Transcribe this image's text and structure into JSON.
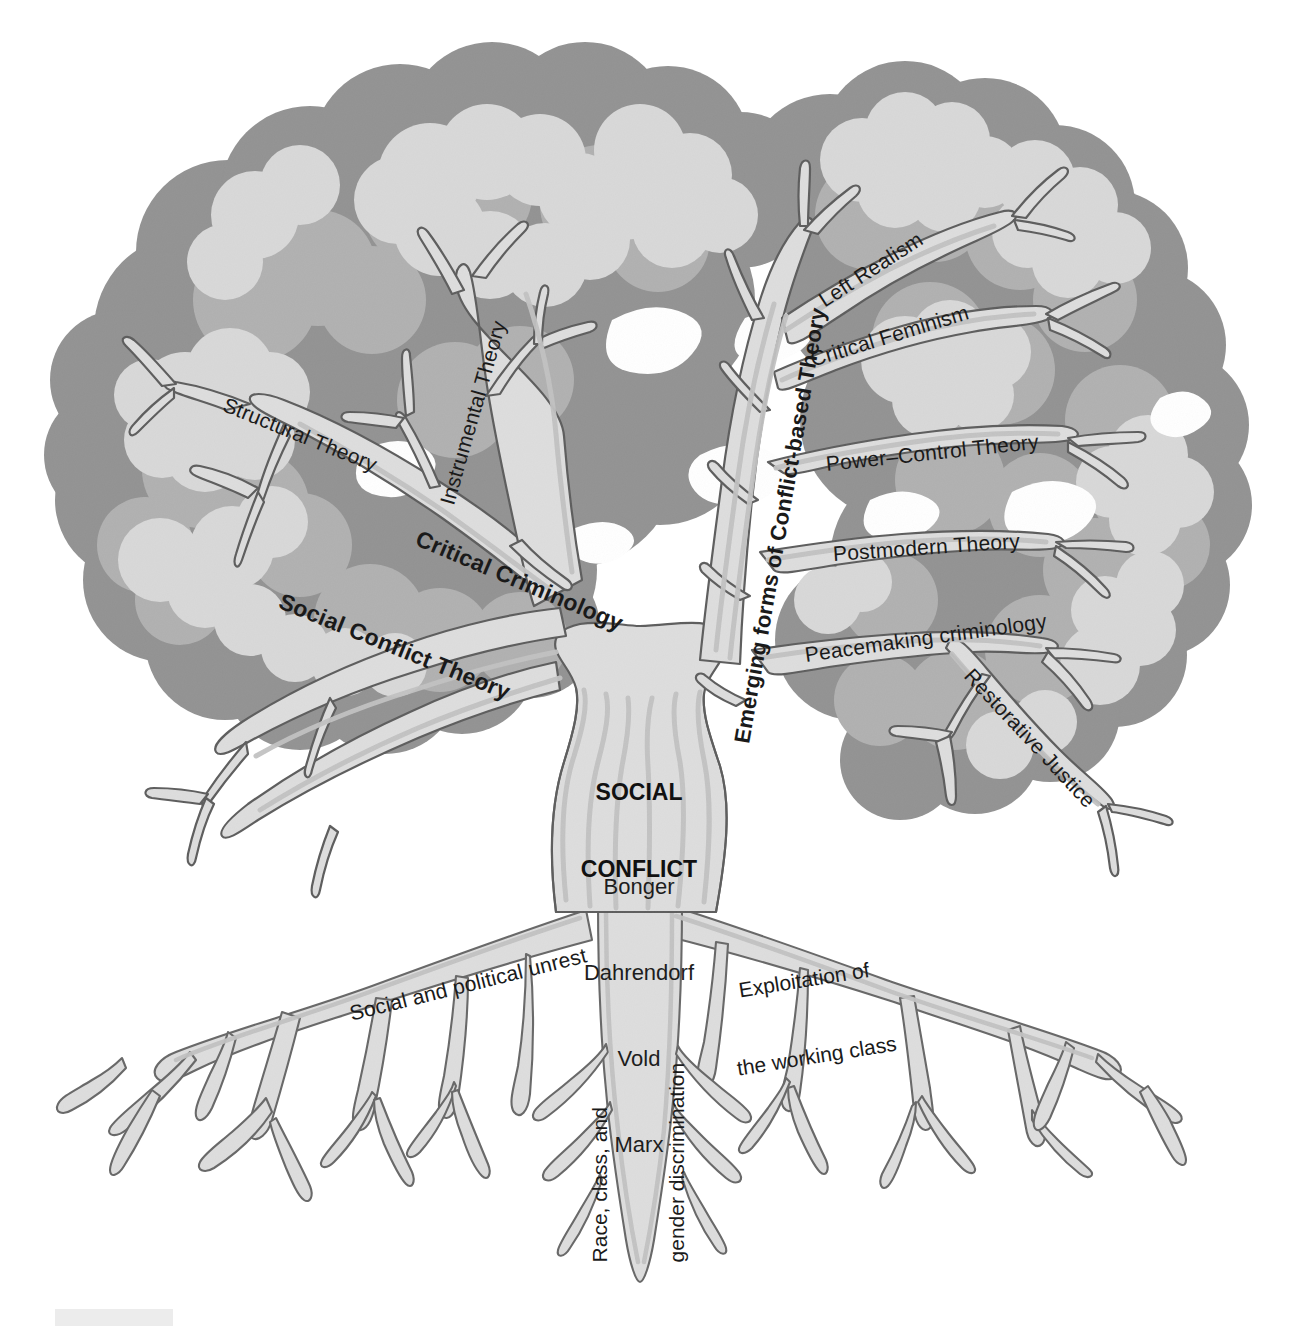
{
  "figure": {
    "kind": "concept-tree-diagram",
    "background_color": "#ffffff"
  },
  "palette": {
    "canopy_dark": "#949494",
    "canopy_mid": "#b2b2b2",
    "canopy_light": "#d9d9d9",
    "wood_fill": "#dedede",
    "wood_shadow": "#c3c3c3",
    "outline": "#5f5f5f",
    "text": "#1a1a1a",
    "footer_bar": "#ececec"
  },
  "trunk": {
    "core_label": "SOCIAL\nCONFLICT",
    "core_label_line1": "SOCIAL",
    "core_label_line2": "CONFLICT",
    "theorists_block": "Bonger\nDahrendorf\nVold\nMarx",
    "theorists": [
      "Bonger",
      "Dahrendorf",
      "Vold",
      "Marx"
    ]
  },
  "branches": [
    {
      "id": "structural-theory",
      "label": "Structural Theory",
      "weight": "regular",
      "side": "left",
      "x": 224,
      "y": 392,
      "rotate": 22,
      "size": 21
    },
    {
      "id": "instrumental-theory",
      "label": "Instrumental Theory",
      "weight": "regular",
      "side": "left",
      "x": 447,
      "y": 492,
      "rotate": -74,
      "size": 21
    },
    {
      "id": "critical-criminology",
      "label": "Critical Criminology",
      "weight": "bold",
      "side": "left",
      "x": 417,
      "y": 524,
      "rotate": 23,
      "size": 23
    },
    {
      "id": "social-conflict-theory",
      "label": "Social Conflict Theory",
      "weight": "bold",
      "side": "left",
      "x": 280,
      "y": 587,
      "rotate": 22,
      "size": 23
    },
    {
      "id": "emerging-forms-of-conflict-based-theory",
      "label": "Emerging forms of Conflict-based Theory",
      "weight": "bold",
      "side": "center",
      "x": 742,
      "y": 730,
      "rotate": -80,
      "size": 22
    },
    {
      "id": "left-realism",
      "label": "Left Realism",
      "weight": "regular",
      "side": "right",
      "x": 821,
      "y": 290,
      "rotate": -33,
      "size": 21
    },
    {
      "id": "critical-feminism",
      "label": "Critical Feminism",
      "weight": "regular",
      "side": "right",
      "x": 811,
      "y": 348,
      "rotate": -17,
      "size": 21
    },
    {
      "id": "power-control-theory",
      "label": "Power–Control Theory",
      "weight": "regular",
      "side": "right",
      "x": 826,
      "y": 452,
      "rotate": -6,
      "size": 21
    },
    {
      "id": "postmodern-theory",
      "label": "Postmodern Theory",
      "weight": "regular",
      "side": "right",
      "x": 833,
      "y": 542,
      "rotate": -4,
      "size": 21
    },
    {
      "id": "peacemaking-criminology",
      "label": "Peacemaking criminology",
      "weight": "regular",
      "side": "right",
      "x": 805,
      "y": 643,
      "rotate": -8,
      "size": 21
    },
    {
      "id": "restorative-justice",
      "label": "Restorative Justice",
      "weight": "regular",
      "side": "right",
      "x": 968,
      "y": 660,
      "rotate": 47,
      "size": 21
    }
  ],
  "roots": [
    {
      "id": "social-and-political-unrest",
      "label": "Social and political unrest",
      "x": 350,
      "y": 1002,
      "rotate": -14,
      "size": 21
    },
    {
      "id": "exploitation-of-the-working-class",
      "label": "Exploitation of\nthe working class",
      "line1": "Exploitation of",
      "line2": "the working class",
      "x": 745,
      "y": 926,
      "rotate": -9,
      "size": 21
    },
    {
      "id": "race-class-and-gender-discrimination",
      "label": "Race, class, and\ngender discrimination",
      "line1": "Race, class, and",
      "line2": "gender discrimination",
      "x": 638,
      "y": 1160,
      "rotate": -90,
      "size": 21
    }
  ],
  "footer": {
    "bar_visible": true,
    "bar_x": 55,
    "bar_y": 1309,
    "bar_w": 118,
    "bar_h": 17
  }
}
